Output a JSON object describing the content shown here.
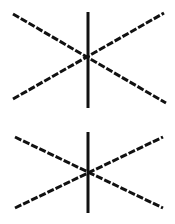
{
  "background": "#ffffff",
  "stroke_color": "#111111",
  "figures": [
    {
      "name": "star-figure-top",
      "vertical": {
        "x": 88,
        "y1": 12,
        "y2": 108,
        "width": 3
      },
      "diagonals": [
        {
          "x1": 13,
          "y1": 14,
          "x2": 166,
          "y2": 103,
          "width": 3
        },
        {
          "x1": 13,
          "y1": 99,
          "x2": 164,
          "y2": 13,
          "width": 3
        }
      ]
    },
    {
      "name": "star-figure-bottom",
      "vertical": {
        "x": 88,
        "y1": 132,
        "y2": 213,
        "width": 3
      },
      "diagonals": [
        {
          "x1": 15,
          "y1": 137,
          "x2": 163,
          "y2": 208,
          "width": 3
        },
        {
          "x1": 15,
          "y1": 208,
          "x2": 163,
          "y2": 137,
          "width": 3
        }
      ]
    }
  ]
}
